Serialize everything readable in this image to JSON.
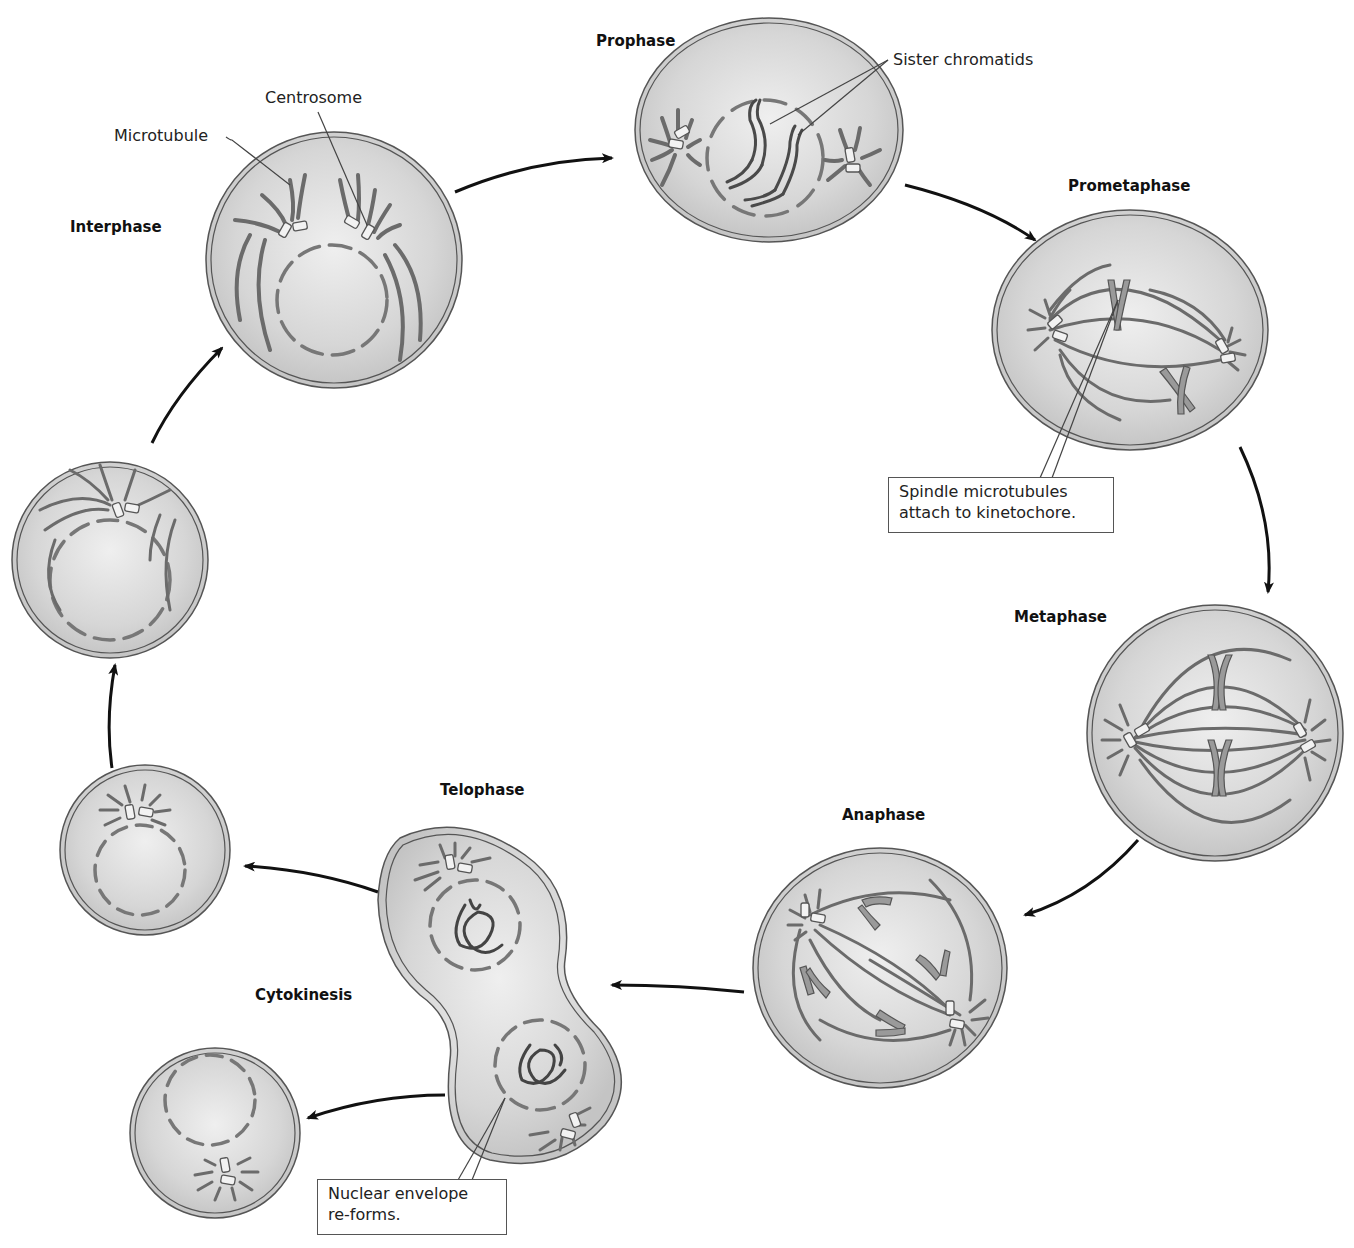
{
  "diagram": {
    "colors": {
      "cell_fill": "#dcdcdc",
      "cell_edge": "#555555",
      "arrow": "#111111",
      "chromosome": "#555555",
      "microtubule": "#6b6b6b"
    },
    "phases": [
      {
        "id": "interphase",
        "label": "Interphase"
      },
      {
        "id": "prophase",
        "label": "Prophase"
      },
      {
        "id": "prometaphase",
        "label": "Prometaphase"
      },
      {
        "id": "metaphase",
        "label": "Metaphase"
      },
      {
        "id": "anaphase",
        "label": "Anaphase"
      },
      {
        "id": "telophase",
        "label": "Telophase"
      },
      {
        "id": "cytokinesis",
        "label": "Cytokinesis"
      }
    ],
    "callouts": {
      "centrosome": "Centrosome",
      "microtubule": "Microtubule",
      "sister_chromatids": "Sister chromatids",
      "kinetochore_line1": "Spindle microtubules",
      "kinetochore_line2": "attach to kinetochore.",
      "envelope_line1": "Nuclear envelope",
      "envelope_line2": "re-forms."
    }
  }
}
